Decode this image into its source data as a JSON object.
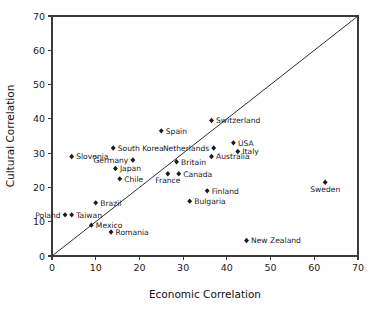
{
  "chart_data": {
    "type": "scatter",
    "title": "",
    "xlabel": "Economic Correlation",
    "ylabel": "Cultural Correlation",
    "xlim": [
      0,
      70
    ],
    "ylim": [
      0,
      70
    ],
    "xticks": [
      0,
      10,
      20,
      30,
      40,
      50,
      60,
      70
    ],
    "yticks": [
      0,
      10,
      20,
      30,
      40,
      50,
      60,
      70
    ],
    "grid": false,
    "legend": "none",
    "annotations": [
      {
        "name": "identity-line",
        "kind": "line",
        "description": "45-degree reference line y = x drawn from (0,0) to (70,70)",
        "from": [
          0,
          0
        ],
        "to": [
          70,
          70
        ]
      }
    ],
    "points": [
      {
        "label": "Poland",
        "x": 3.0,
        "y": 12.0,
        "label_pos": "left"
      },
      {
        "label": "Taiwan",
        "x": 4.5,
        "y": 12.0,
        "label_pos": "right"
      },
      {
        "label": "Slovenia",
        "x": 4.5,
        "y": 29.0,
        "label_pos": "right"
      },
      {
        "label": "Mexico",
        "x": 9.0,
        "y": 9.0,
        "label_pos": "right"
      },
      {
        "label": "Brazil",
        "x": 10.0,
        "y": 15.5,
        "label_pos": "right"
      },
      {
        "label": "Romania",
        "x": 13.5,
        "y": 7.0,
        "label_pos": "right"
      },
      {
        "label": "South Korea",
        "x": 14.0,
        "y": 31.5,
        "label_pos": "right"
      },
      {
        "label": "Germany",
        "x": 18.5,
        "y": 28.0,
        "label_pos": "left"
      },
      {
        "label": "Japan",
        "x": 14.5,
        "y": 25.5,
        "label_pos": "right"
      },
      {
        "label": "Chile",
        "x": 15.5,
        "y": 22.5,
        "label_pos": "right"
      },
      {
        "label": "Spain",
        "x": 25.0,
        "y": 36.5,
        "label_pos": "right"
      },
      {
        "label": "Britain",
        "x": 28.5,
        "y": 27.5,
        "label_pos": "right"
      },
      {
        "label": "France",
        "x": 26.5,
        "y": 24.0,
        "label_pos": "below"
      },
      {
        "label": "Canada",
        "x": 29.0,
        "y": 24.0,
        "label_pos": "right"
      },
      {
        "label": "Bulgaria",
        "x": 31.5,
        "y": 16.0,
        "label_pos": "right"
      },
      {
        "label": "Finland",
        "x": 35.5,
        "y": 19.0,
        "label_pos": "right"
      },
      {
        "label": "Switzerland",
        "x": 36.5,
        "y": 39.5,
        "label_pos": "right"
      },
      {
        "label": "Netherlands",
        "x": 37.0,
        "y": 31.5,
        "label_pos": "left"
      },
      {
        "label": "Australia",
        "x": 36.5,
        "y": 29.0,
        "label_pos": "right"
      },
      {
        "label": "USA",
        "x": 41.5,
        "y": 33.0,
        "label_pos": "right"
      },
      {
        "label": "Italy",
        "x": 42.5,
        "y": 30.5,
        "label_pos": "right"
      },
      {
        "label": "New Zealand",
        "x": 44.5,
        "y": 4.5,
        "label_pos": "right"
      },
      {
        "label": "Sweden",
        "x": 62.5,
        "y": 21.5,
        "label_pos": "below"
      }
    ]
  }
}
